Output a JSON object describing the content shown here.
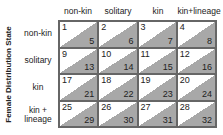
{
  "axis_label": "Female Distribution State",
  "columns": [
    "non-kin",
    "solitary",
    "kin",
    "kin+lineage"
  ],
  "rows": [
    "non-kin",
    "solitary",
    "kin",
    "kin + lineage"
  ],
  "cells": [
    [
      {
        "top": "1",
        "bottom": "5"
      },
      {
        "top": "2",
        "bottom": "6"
      },
      {
        "top": "3",
        "bottom": "7"
      },
      {
        "top": "4",
        "bottom": "8"
      }
    ],
    [
      {
        "top": "9",
        "bottom": "13"
      },
      {
        "top": "10",
        "bottom": "14"
      },
      {
        "top": "11",
        "bottom": "15"
      },
      {
        "top": "12",
        "bottom": "16"
      }
    ],
    [
      {
        "top": "17",
        "bottom": "21"
      },
      {
        "top": "18",
        "bottom": "22"
      },
      {
        "top": "19",
        "bottom": "23"
      },
      {
        "top": "20",
        "bottom": "24"
      }
    ],
    [
      {
        "top": "25",
        "bottom": "29"
      },
      {
        "top": "26",
        "bottom": "30"
      },
      {
        "top": "27",
        "bottom": "31"
      },
      {
        "top": "28",
        "bottom": "32"
      }
    ]
  ],
  "colors": {
    "shade": "#a8a8a8",
    "border": "#666666"
  }
}
